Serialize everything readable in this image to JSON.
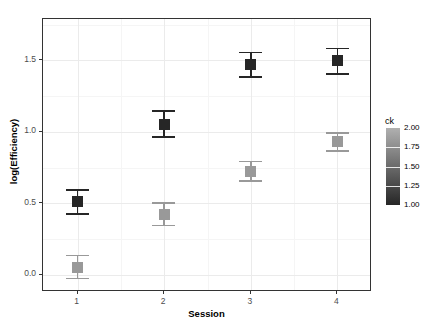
{
  "chart_data": {
    "type": "scatter",
    "title": "",
    "xlabel": "Session",
    "ylabel": "log(Efficiency)",
    "x": [
      1,
      2,
      3,
      4
    ],
    "xtick_labels": [
      "1",
      "2",
      "3",
      "4"
    ],
    "ytick_labels": [
      "0.0",
      "0.5",
      "1.0",
      "1.5"
    ],
    "ytick_values": [
      0.0,
      0.5,
      1.0,
      1.5
    ],
    "ylim": [
      -0.12,
      1.79
    ],
    "xlim": [
      0.6,
      4.4
    ],
    "grid": true,
    "legend": {
      "title": "ck",
      "type": "continuous-colorbar",
      "position": "right",
      "ticks": [
        "2.00",
        "1.75",
        "1.50",
        "1.25",
        "1.00"
      ],
      "tick_values": [
        2.0,
        1.75,
        1.5,
        1.25,
        1.0
      ],
      "color_low": "#262626",
      "color_high": "#b0b0b0"
    },
    "series": [
      {
        "name": "ck = 1.00",
        "ck": 1.0,
        "color": "#262626",
        "points": [
          {
            "x": 1,
            "y": 0.51,
            "ymin": 0.42,
            "ymax": 0.6
          },
          {
            "x": 2,
            "y": 1.05,
            "ymin": 0.96,
            "ymax": 1.15
          },
          {
            "x": 3,
            "y": 1.47,
            "ymin": 1.38,
            "ymax": 1.56
          },
          {
            "x": 4,
            "y": 1.5,
            "ymin": 1.4,
            "ymax": 1.59
          }
        ]
      },
      {
        "name": "ck = 2.00",
        "ck": 2.0,
        "color": "#999999",
        "points": [
          {
            "x": 1,
            "y": 0.05,
            "ymin": -0.03,
            "ymax": 0.14
          },
          {
            "x": 2,
            "y": 0.42,
            "ymin": 0.34,
            "ymax": 0.51
          },
          {
            "x": 3,
            "y": 0.72,
            "ymin": 0.65,
            "ymax": 0.8
          },
          {
            "x": 4,
            "y": 0.93,
            "ymin": 0.86,
            "ymax": 1.0
          }
        ]
      }
    ]
  }
}
